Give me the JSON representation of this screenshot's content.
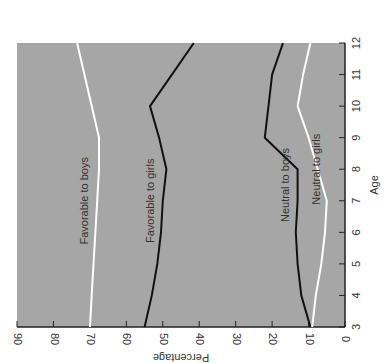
{
  "chart_data": {
    "type": "line",
    "title": "",
    "xlabel": "Age",
    "ylabel": "Percentage",
    "x": [
      3,
      4,
      5,
      6,
      7,
      8,
      9,
      10,
      11,
      12
    ],
    "xlim": [
      3,
      12
    ],
    "ylim": [
      0,
      90
    ],
    "x_ticks": [
      "3",
      "4",
      "5",
      "6",
      "7",
      "8",
      "9",
      "10",
      "11",
      "12"
    ],
    "y_ticks": [
      "0",
      "10",
      "20",
      "30",
      "40",
      "50",
      "60",
      "70",
      "80",
      "90"
    ],
    "grid": false,
    "orientation": "rotated 90 degrees (percentage axis drawn horizontally at bottom, reversed; age axis drawn vertically on right)",
    "background_color": "#a6a6a6",
    "series": [
      {
        "name": "Favorable to boys",
        "color": "#ffffff",
        "values": [
          70,
          69.5,
          69,
          68.5,
          68,
          67.5,
          67.5,
          69.5,
          71.5,
          73.5
        ]
      },
      {
        "name": "Favorable to girls",
        "color": "#111111",
        "values": [
          55,
          53,
          51.5,
          50.5,
          50,
          49,
          51,
          53.5,
          47.5,
          41.5
        ]
      },
      {
        "name": "Neutral to boys",
        "color": "#111111",
        "values": [
          9.5,
          12,
          13,
          13.5,
          13,
          13,
          22,
          21,
          20,
          17
        ]
      },
      {
        "name": "Neutral to girls",
        "color": "#ffffff",
        "values": [
          9,
          8,
          6.5,
          5.5,
          5,
          7.5,
          10,
          13,
          11.5,
          9.5
        ]
      }
    ],
    "annotations": [
      "Favorable to boys",
      "Favorable to girls",
      "Neutral to boys",
      "Neutral to girls"
    ]
  }
}
